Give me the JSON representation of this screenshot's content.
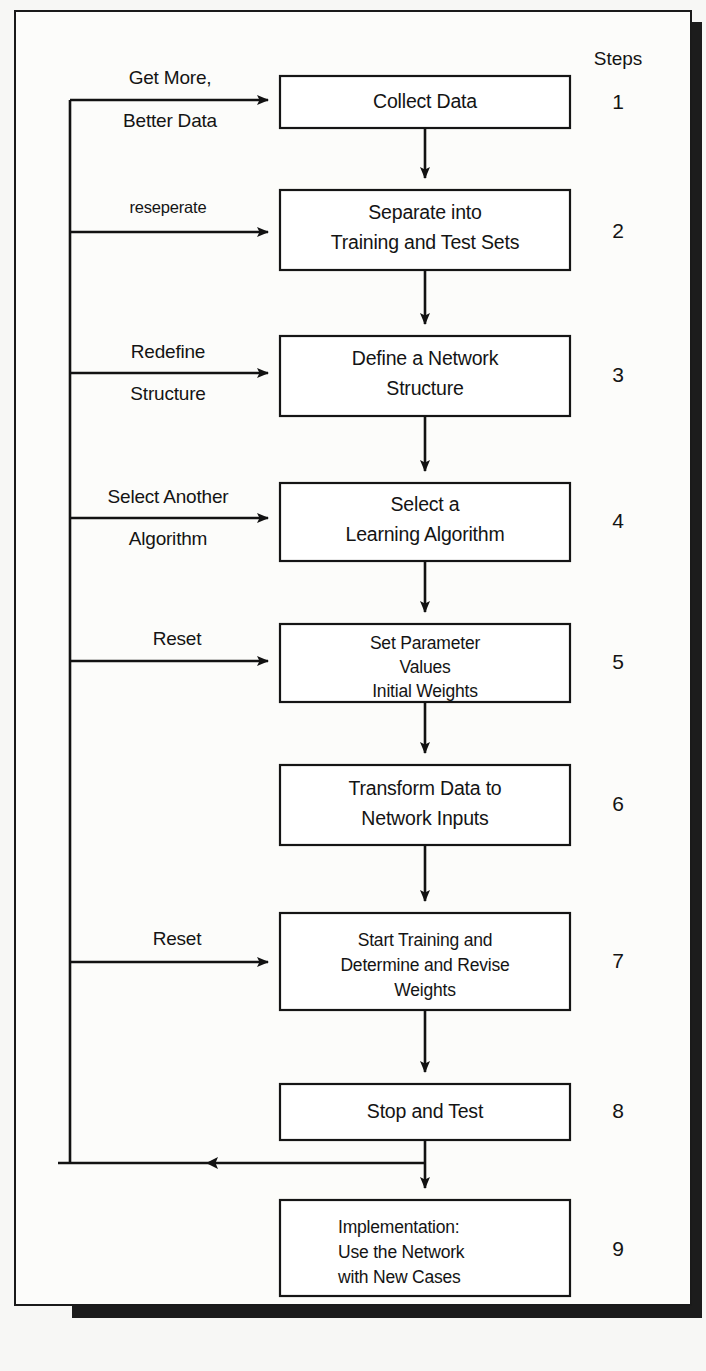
{
  "diagram": {
    "steps_header": "Steps",
    "colors": {
      "line": "#121212",
      "box_fill": "#ffffff",
      "page_bg": "#f7f7f5",
      "shadow": "#1c1c1c"
    },
    "nodes": [
      {
        "step": "1",
        "lines": [
          "Collect Data"
        ]
      },
      {
        "step": "2",
        "lines": [
          "Separate into",
          "Training and Test Sets"
        ]
      },
      {
        "step": "3",
        "lines": [
          "Define a Network",
          "Structure"
        ]
      },
      {
        "step": "4",
        "lines": [
          "Select a",
          "Learning Algorithm"
        ]
      },
      {
        "step": "5",
        "lines": [
          "Set Parameter",
          "Values",
          "Initial Weights"
        ]
      },
      {
        "step": "6",
        "lines": [
          "Transform Data to",
          "Network Inputs"
        ]
      },
      {
        "step": "7",
        "lines": [
          "Start Training and",
          "Determine and Revise",
          "Weights"
        ]
      },
      {
        "step": "8",
        "lines": [
          "Stop and Test"
        ]
      },
      {
        "step": "9",
        "lines": [
          "Implementation:",
          "Use the Network",
          "with New Cases"
        ]
      }
    ],
    "feedback_labels": [
      {
        "id": "to-step-1",
        "lines": [
          "Get More,",
          "Better Data"
        ]
      },
      {
        "id": "to-step-2",
        "lines": [
          "reseperate"
        ]
      },
      {
        "id": "to-step-3",
        "lines": [
          "Redefine",
          "Structure"
        ]
      },
      {
        "id": "to-step-4",
        "lines": [
          "Select Another",
          "Algorithm"
        ]
      },
      {
        "id": "to-step-5",
        "lines": [
          "Reset"
        ]
      },
      {
        "id": "to-step-7",
        "lines": [
          "Reset"
        ]
      }
    ]
  }
}
